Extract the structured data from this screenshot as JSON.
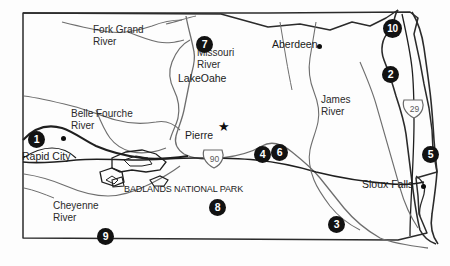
{
  "map": {
    "title": "South Dakota reference map",
    "background_color": "#fdfdfd",
    "border_color": "#2b2b2b",
    "river_color": "#6e6e6e",
    "marker_color": "#121212",
    "marker_text_color": "#ffffff"
  },
  "cities": [
    {
      "name": "Rapid City",
      "x": 22,
      "y": 150,
      "dot_x": 61,
      "dot_y": 136,
      "type": "city"
    },
    {
      "name": "Aberdeen",
      "x": 272,
      "y": 38,
      "dot_x": 317,
      "dot_y": 44,
      "type": "city"
    },
    {
      "name": "Pierre",
      "x": 185,
      "y": 129,
      "dot_x": 222,
      "dot_y": 126,
      "type": "capital"
    },
    {
      "name": "Sioux Falls",
      "x": 362,
      "y": 178,
      "dot_x": 421,
      "dot_y": 184,
      "type": "city"
    }
  ],
  "rivers": [
    {
      "name": "Fork Grand\nRiver",
      "line1": "Fork Grand",
      "line2": "River",
      "x": 93,
      "y": 24
    },
    {
      "name": "Missouri River",
      "line1": "Missouri",
      "line2": "River",
      "x": 197,
      "y": 47
    },
    {
      "name": "Belle Fourche River",
      "line1": "Belle Fourche",
      "line2": "River",
      "x": 71,
      "y": 108
    },
    {
      "name": "Cheyenne River",
      "line1": "Cheyenne",
      "line2": "River",
      "x": 53,
      "y": 200
    },
    {
      "name": "James River",
      "line1": "James",
      "line2": "River",
      "x": 321,
      "y": 94
    }
  ],
  "lakes": [
    {
      "name": "LakeOahe",
      "x": 178,
      "y": 72
    }
  ],
  "parks": [
    {
      "name": "BADLANDS NATIONAL PARK",
      "x": 124,
      "y": 184
    }
  ],
  "highways": [
    {
      "name": "90",
      "x": 212,
      "y": 158,
      "type": "interstate"
    },
    {
      "name": "29",
      "x": 412,
      "y": 108,
      "type": "interstate"
    }
  ],
  "markers": [
    {
      "label": "1",
      "x": 28,
      "y": 131
    },
    {
      "label": "2",
      "x": 382,
      "y": 66
    },
    {
      "label": "3",
      "x": 328,
      "y": 216
    },
    {
      "label": "4",
      "x": 254,
      "y": 146
    },
    {
      "label": "5",
      "x": 422,
      "y": 146
    },
    {
      "label": "6",
      "x": 271,
      "y": 144
    },
    {
      "label": "7",
      "x": 196,
      "y": 36
    },
    {
      "label": "8",
      "x": 209,
      "y": 199
    },
    {
      "label": "9",
      "x": 97,
      "y": 228
    },
    {
      "label": "10",
      "x": 383,
      "y": 19
    }
  ]
}
